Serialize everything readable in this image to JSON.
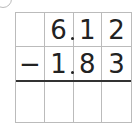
{
  "problem": {
    "operator": "−",
    "minuend": [
      "",
      "6",
      "1",
      "2"
    ],
    "subtrahend": [
      "−",
      "1",
      "8",
      "3"
    ],
    "answer": [
      "",
      "",
      "",
      ""
    ],
    "decimal_after_column": 1
  },
  "colors": {
    "grid": "#bbbbbb",
    "rule": "#333333",
    "text": "#222222"
  }
}
